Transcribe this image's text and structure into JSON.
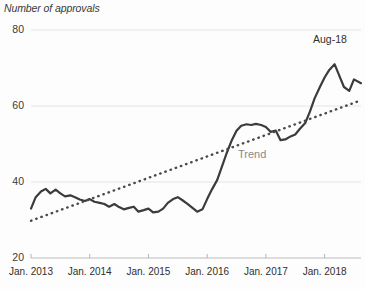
{
  "chart_data": {
    "type": "line",
    "title": "Number of approvals",
    "xlabel": "",
    "ylabel": "Number of approvals",
    "ylim": [
      20,
      80
    ],
    "yticks": [
      20,
      40,
      60,
      80
    ],
    "ytick_labels": [
      "20",
      "40",
      "60",
      "80"
    ],
    "xtick_labels": [
      "Jan. 2013",
      "Jan. 2014",
      "Jan. 2015",
      "Jan. 2016",
      "Jan. 2017",
      "Jan. 2018"
    ],
    "xtick_years": [
      2013,
      2014,
      2015,
      2016,
      2017,
      2018
    ],
    "grid": "horizontal",
    "legend": "none",
    "annotations": [
      {
        "name": "last-point-label",
        "text": "Aug-18"
      },
      {
        "name": "trend-series-label",
        "text": "Trend"
      }
    ],
    "x_start": 2013.0,
    "x_end": 2018.62,
    "series": [
      {
        "name": "Approvals",
        "style": "solid",
        "color": "#3b3b3b",
        "x": [
          2013.0,
          2013.08,
          2013.17,
          2013.25,
          2013.33,
          2013.42,
          2013.5,
          2013.58,
          2013.67,
          2013.75,
          2013.83,
          2013.92,
          2014.0,
          2014.08,
          2014.17,
          2014.25,
          2014.33,
          2014.42,
          2014.5,
          2014.58,
          2014.67,
          2014.75,
          2014.83,
          2014.92,
          2015.0,
          2015.08,
          2015.17,
          2015.25,
          2015.33,
          2015.42,
          2015.5,
          2015.58,
          2015.67,
          2015.75,
          2015.83,
          2015.92,
          2016.0,
          2016.08,
          2016.17,
          2016.25,
          2016.33,
          2016.42,
          2016.5,
          2016.58,
          2016.67,
          2016.75,
          2016.83,
          2016.92,
          2017.0,
          2017.08,
          2017.17,
          2017.25,
          2017.33,
          2017.42,
          2017.5,
          2017.58,
          2017.67,
          2017.75,
          2017.83,
          2017.92,
          2018.0,
          2018.08,
          2018.17,
          2018.25,
          2018.33,
          2018.42,
          2018.5,
          2018.62
        ],
        "values": [
          33.0,
          36.0,
          37.5,
          38.2,
          37.0,
          38.0,
          37.0,
          36.2,
          36.5,
          36.0,
          35.4,
          35.0,
          35.5,
          34.8,
          34.5,
          34.2,
          33.5,
          34.2,
          33.4,
          32.8,
          33.2,
          33.5,
          32.2,
          32.6,
          33.0,
          32.0,
          32.2,
          33.0,
          34.5,
          35.5,
          36.0,
          35.2,
          34.2,
          33.2,
          32.2,
          32.8,
          35.5,
          38.0,
          40.5,
          44.0,
          47.5,
          51.0,
          53.5,
          54.8,
          55.2,
          55.0,
          55.3,
          55.0,
          54.5,
          53.2,
          53.5,
          51.0,
          51.2,
          52.0,
          52.5,
          54.0,
          55.5,
          58.5,
          62.0,
          65.0,
          67.5,
          69.5,
          71.0,
          68.0,
          65.0,
          64.0,
          67.0,
          66.0
        ]
      },
      {
        "name": "Trend",
        "style": "dotted",
        "color": "#4a4a4a",
        "x": [
          2013.0,
          2018.62
        ],
        "values": [
          29.8,
          61.5
        ]
      }
    ]
  }
}
